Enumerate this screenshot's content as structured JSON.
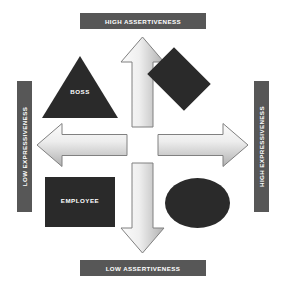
{
  "diagram": {
    "background_color": "#ffffff",
    "banner_color": "#575757",
    "banner_text_color": "#ffffff",
    "shape_color": "#2a2a2a",
    "arrow_fill_light": "#f2f2f2",
    "arrow_fill_dark": "#b4b4b4",
    "arrow_stroke": "#7f7f7f"
  },
  "axes": {
    "top": {
      "label": "HIGH ASSERTIVENESS"
    },
    "bottom": {
      "label": "LOW ASSERTIVENESS"
    },
    "left": {
      "label": "LOW EXPRESSIVENESS"
    },
    "right": {
      "label": "HIGH EXPRESSIVENESS"
    }
  },
  "arrows": [
    {
      "name": "up-arrow",
      "direction": "up"
    },
    {
      "name": "down-arrow",
      "direction": "down"
    },
    {
      "name": "left-arrow",
      "direction": "left"
    },
    {
      "name": "right-arrow",
      "direction": "right"
    }
  ],
  "quadrants": [
    {
      "name": "top-left",
      "shape": "triangle",
      "label": "BOSS"
    },
    {
      "name": "top-right",
      "shape": "diamond",
      "label": ""
    },
    {
      "name": "bottom-left",
      "shape": "rectangle",
      "label": "EMPLOYEE"
    },
    {
      "name": "bottom-right",
      "shape": "ellipse",
      "label": ""
    }
  ]
}
